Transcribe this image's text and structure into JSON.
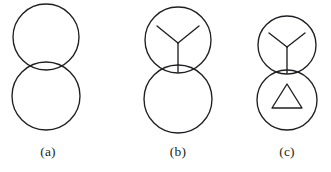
{
  "figure": {
    "background_color": "#ffffff",
    "stroke_color": "#1f1f23",
    "stroke_width": 1.35,
    "panels": [
      {
        "id": "panel-a",
        "caption": "(a)",
        "shapes": [
          {
            "kind": "circle",
            "name": "top-circle",
            "cx": 46,
            "cy": 37,
            "r": 33
          },
          {
            "kind": "circle",
            "name": "bottom-circle",
            "cx": 46,
            "cy": 96,
            "r": 34
          }
        ]
      },
      {
        "id": "panel-b",
        "caption": "(b)",
        "shapes": [
          {
            "kind": "circle",
            "name": "top-circle",
            "cx": 178,
            "cy": 40,
            "r": 33
          },
          {
            "kind": "circle",
            "name": "bottom-circle",
            "cx": 178,
            "cy": 99,
            "r": 34
          },
          {
            "kind": "y-mark",
            "name": "y-junction-top",
            "center_x": 178,
            "center_y": 43,
            "stem_end_y": 72,
            "left_arm_x": 157,
            "left_arm_y": 26,
            "right_arm_x": 199,
            "right_arm_y": 26
          }
        ]
      },
      {
        "id": "panel-c",
        "caption": "(c)",
        "shapes": [
          {
            "kind": "circle",
            "name": "top-circle",
            "cx": 287,
            "cy": 45,
            "r": 29
          },
          {
            "kind": "circle",
            "name": "bottom-circle",
            "cx": 287,
            "cy": 100,
            "r": 30
          },
          {
            "kind": "y-mark",
            "name": "y-junction-top",
            "center_x": 287,
            "center_y": 47,
            "stem_end_y": 73,
            "left_arm_x": 269,
            "left_arm_y": 33,
            "right_arm_x": 305,
            "right_arm_y": 33
          },
          {
            "kind": "triangle",
            "name": "triangle-mark-bottom",
            "apex_x": 287,
            "apex_y": 84,
            "base_left_x": 272,
            "base_right_x": 302,
            "base_y": 108
          }
        ]
      }
    ]
  },
  "captions": {
    "a": "(a)",
    "b": "(b)",
    "c": "(c)"
  }
}
